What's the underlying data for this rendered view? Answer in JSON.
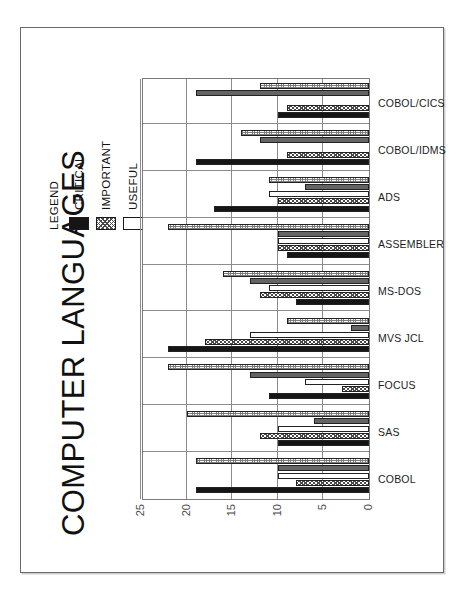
{
  "page": {
    "title": "COMPUTER LANGUAGES"
  },
  "legend": {
    "title": "LEGEND",
    "items": [
      {
        "label": "CRITICAL",
        "fill": "f-critical",
        "color": "#151515"
      },
      {
        "label": "IMPORTANT",
        "fill": "f-important",
        "color": "#9a9a9a"
      },
      {
        "label": "USEFUL",
        "fill": "f-useful",
        "color": "#ffffff"
      },
      {
        "label": "FUTURE",
        "fill": "f-future",
        "color": "#646464"
      },
      {
        "label": "NONE",
        "fill": "f-none",
        "color": "#c8c8c8"
      }
    ]
  },
  "chart_data": {
    "type": "bar",
    "title": "COMPUTER LANGUAGES",
    "xlabel": "",
    "ylabel": "",
    "ylim": [
      0,
      25
    ],
    "yticks": [
      0,
      5,
      10,
      15,
      20,
      25
    ],
    "grid": true,
    "orientation": "vertical",
    "legend_position": "top-right",
    "categories": [
      "COBOL",
      "SAS",
      "FOCUS",
      "MVS JCL",
      "MS-DOS",
      "ASSEMBLER",
      "ADS",
      "COBOL/IDMS",
      "COBOL/CICS"
    ],
    "series": [
      {
        "name": "CRITICAL",
        "fill": "f-critical",
        "values": [
          19,
          10,
          11,
          22,
          8,
          9,
          17,
          19,
          10
        ]
      },
      {
        "name": "IMPORTANT",
        "fill": "f-important",
        "values": [
          8,
          12,
          3,
          18,
          12,
          10,
          10,
          9,
          9
        ]
      },
      {
        "name": "USEFUL",
        "fill": "f-useful",
        "values": [
          10,
          10,
          7,
          13,
          11,
          10,
          11,
          0,
          0
        ]
      },
      {
        "name": "FUTURE",
        "fill": "f-future",
        "values": [
          10,
          6,
          13,
          2,
          13,
          10,
          7,
          12,
          19
        ]
      },
      {
        "name": "NONE",
        "fill": "f-none",
        "values": [
          19,
          20,
          22,
          9,
          16,
          22,
          11,
          14,
          12
        ]
      }
    ]
  }
}
